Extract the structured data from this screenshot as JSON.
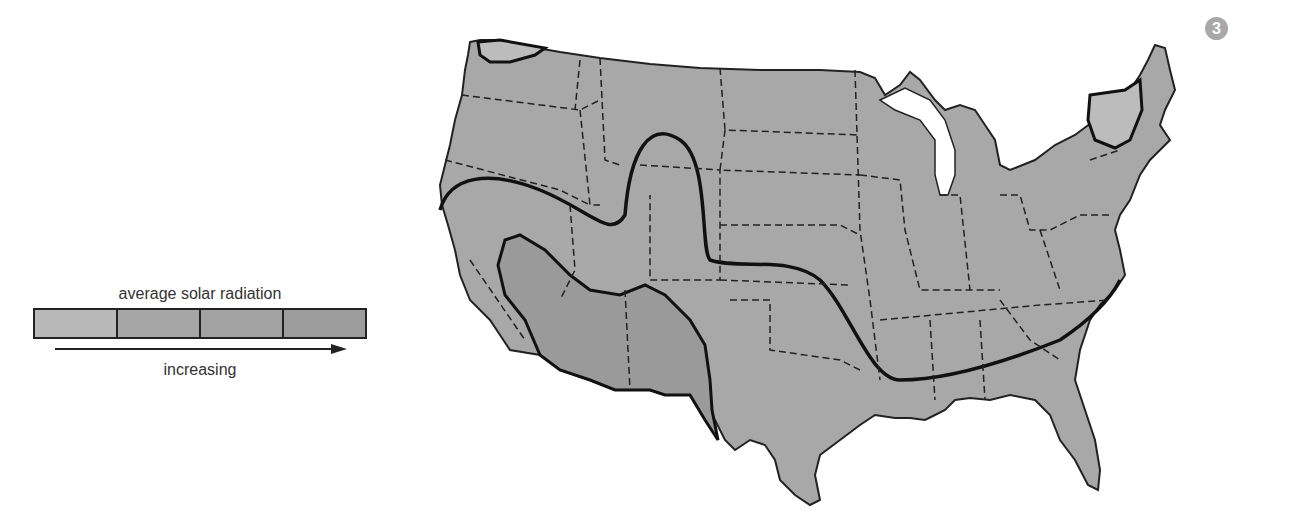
{
  "figure": {
    "badge_number": "3"
  },
  "legend": {
    "title": "average solar radiation",
    "caption": "increasing",
    "swatches": [
      {
        "level": 1,
        "color": "#b8b8b8"
      },
      {
        "level": 2,
        "color": "#a6a6a6"
      },
      {
        "level": 3,
        "color": "#a2a2a2"
      },
      {
        "level": 4,
        "color": "#9c9c9c"
      }
    ],
    "arrow_direction": "right"
  },
  "map": {
    "region": "Contiguous United States",
    "land_color": "#a8a8a8",
    "water_color": "#ffffff",
    "state_borders": "dashed",
    "zone_boundaries": "solid thick",
    "zones": [
      {
        "level": 1,
        "areas": [
          "Northwest Washington",
          "Northern New England (Vermont/New Hampshire)"
        ]
      },
      {
        "level": 2,
        "areas": [
          "Northern and eastern US"
        ]
      },
      {
        "level": 3,
        "areas": [
          "Central/Southern band incl. Nevada, Utah, Colorado, southern Plains, Southeast"
        ]
      },
      {
        "level": 4,
        "areas": [
          "Desert Southwest: southern California, Arizona, New Mexico, West Texas"
        ]
      }
    ]
  }
}
